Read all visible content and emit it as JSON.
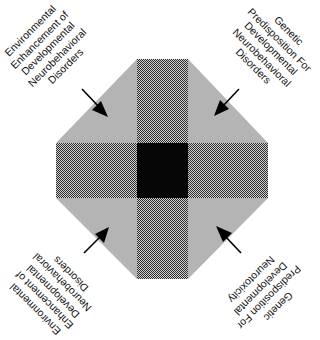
{
  "figure": {
    "type": "octagon-quadrant-diagram",
    "colors": {
      "background": "#ffffff",
      "corner_regions": "#b4b4b4",
      "bands_pattern_light": "#d0d0d0",
      "bands_pattern_dark": "#3a3a3a",
      "center_square": "#050505",
      "arrows": "#000000",
      "text": "#111111"
    },
    "labels": {
      "top_left": {
        "lines": [
          "Environmental",
          "Enhancement of",
          "Developmental",
          "Neurobehavioral",
          "Disorders"
        ]
      },
      "top_right": {
        "lines": [
          "Genetic",
          "Predisposition For",
          "Developmental",
          "Neurobehavioral",
          "Disorders"
        ]
      },
      "bottom_left": {
        "lines": [
          "Environmental",
          "Enhancement of",
          "Developmental",
          "Neurobehavioral",
          "Disorders"
        ]
      },
      "bottom_right": {
        "lines": [
          "Genetic",
          "Predisposition For",
          "Developmental",
          "Neurotoxicity"
        ]
      }
    },
    "arrows": [
      {
        "id": "top-left",
        "direction": "inward"
      },
      {
        "id": "top-right",
        "direction": "inward"
      },
      {
        "id": "bottom-left",
        "direction": "inward"
      },
      {
        "id": "bottom-right",
        "direction": "inward"
      }
    ]
  }
}
